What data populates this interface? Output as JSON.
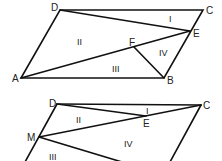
{
  "diagrams": [
    {
      "name": "parallelogram-top",
      "points": {
        "A": [
          21,
          78
        ],
        "B": [
          164,
          78
        ],
        "C": [
          203,
          10
        ],
        "D": [
          60,
          10
        ],
        "E": [
          190,
          31
        ],
        "F": [
          134,
          47
        ]
      },
      "vertex_labels": {
        "A": "A",
        "B": "B",
        "C": "C",
        "D": "D",
        "E": "E",
        "F": "F"
      },
      "segments": [
        [
          "A",
          "B"
        ],
        [
          "B",
          "C"
        ],
        [
          "C",
          "D"
        ],
        [
          "D",
          "A"
        ],
        [
          "D",
          "E"
        ],
        [
          "A",
          "E"
        ],
        [
          "F",
          "B"
        ]
      ],
      "regions": {
        "I": "I",
        "II": "II",
        "III": "III",
        "IV": "IV"
      }
    },
    {
      "name": "parallelogram-bottom",
      "points": {
        "D": [
          57,
          104
        ],
        "C": [
          201,
          105
        ],
        "E": [
          146,
          116
        ],
        "M": [
          39,
          137
        ]
      },
      "vertex_labels": {
        "D": "D",
        "C": "C",
        "E": "E",
        "M": "M"
      },
      "segments": [
        [
          "D",
          "C"
        ],
        [
          "D",
          "E"
        ],
        [
          "E",
          "C"
        ],
        [
          "M",
          "C"
        ],
        [
          "D",
          "M"
        ]
      ],
      "regions": {
        "I": "I",
        "II": "II",
        "III": "III",
        "IV": "IV"
      }
    }
  ],
  "colors": {
    "stroke": "#111111",
    "text": "#222222",
    "background": "#ffffff"
  }
}
